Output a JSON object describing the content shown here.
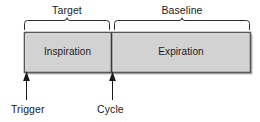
{
  "diagram": {
    "brackets": [
      {
        "name": "target",
        "label": "Target",
        "x_start": 24,
        "x_end": 110
      },
      {
        "name": "baseline",
        "label": "Baseline",
        "x_start": 114,
        "x_end": 250
      }
    ],
    "phases": [
      {
        "name": "inspiration",
        "label": "Inspiration",
        "x_start": 24,
        "x_end": 111
      },
      {
        "name": "expiration",
        "label": "Expiration",
        "x_start": 111,
        "x_end": 250
      }
    ],
    "markers": [
      {
        "name": "trigger",
        "label": "Trigger",
        "x": 26
      },
      {
        "name": "cycle",
        "label": "Cycle",
        "x": 112
      }
    ],
    "colors": {
      "bar_fill": "#d2d2d2",
      "bar_border": "#555555",
      "line": "#1a1a1a",
      "text": "#1a1a1a",
      "background": "#ffffff"
    },
    "geometry": {
      "bar_top": 32,
      "bar_bottom": 72,
      "bracket_top": 20,
      "bracket_bottom": 29
    }
  }
}
